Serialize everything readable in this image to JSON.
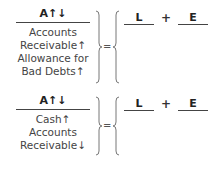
{
  "blocks": [
    {
      "header": "A↑↓",
      "items": [
        "Accounts",
        "Receivable↑",
        "Allowance for",
        "Bad Debts↑"
      ],
      "equals": "=",
      "rhs": {
        "left": "L",
        "operator": "+",
        "right": "E"
      }
    },
    {
      "header": "A↑↓",
      "items": [
        "Cash↑",
        "Accounts",
        "Receivable↓"
      ],
      "equals": "=",
      "rhs": {
        "left": "L",
        "operator": "+",
        "right": "E"
      }
    }
  ]
}
